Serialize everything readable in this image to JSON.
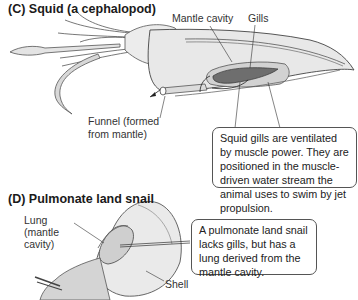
{
  "panels": {
    "squid": {
      "heading": "(C)  Squid (a cephalopod)",
      "labels": {
        "mantle_cavity": "Mantle cavity",
        "gills": "Gills",
        "funnel_line1": "Funnel (formed",
        "funnel_line2": "from mantle)"
      },
      "callout": "Squid gills are ventilated by muscle power. They are positioned in the muscle-driven water stream the animal uses to swim by jet propulsion."
    },
    "snail": {
      "heading": "(D)  Pulmonate land snail",
      "labels": {
        "lung_line1": "Lung",
        "lung_line2": "(mantle",
        "lung_line3": "cavity)",
        "shell": "Shell"
      },
      "callout": "A pulmonate land snail lacks gills, but has a lung derived from the mantle cavity."
    }
  },
  "colors": {
    "body_fill": "#e8e8e8",
    "mantle_fill": "#d0d0d0",
    "gill_fill": "#707070",
    "outline": "#444444"
  }
}
